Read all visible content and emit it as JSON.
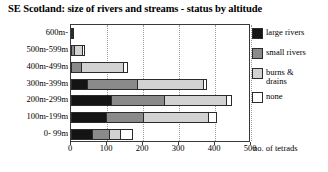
{
  "chart_data": {
    "type": "bar",
    "orientation": "horizontal",
    "stacked": true,
    "title": "SE Scotland: size of rivers and streams - status by altitude",
    "xlabel": "no. of tetrads",
    "ylabel": "",
    "xlim": [
      0,
      500
    ],
    "xticks": [
      0,
      100,
      200,
      300,
      400,
      500
    ],
    "grid": true,
    "legend_position": "right",
    "categories": [
      "600m-",
      "500m-599m",
      "400m-499m",
      "300m-399m",
      "200m-299m",
      "100m-199m",
      "0- 99m"
    ],
    "series": [
      {
        "name": "large rivers",
        "color": "#141414",
        "values": [
          0,
          0,
          0,
          48,
          115,
          100,
          62
        ]
      },
      {
        "name": "small rivers",
        "color": "#8a8a8a",
        "values": [
          0,
          12,
          30,
          142,
          150,
          105,
          48
        ]
      },
      {
        "name": "burns & drains",
        "color": "#d2d2d2",
        "values": [
          4,
          23,
          120,
          185,
          175,
          185,
          35
        ]
      },
      {
        "name": "none",
        "color": "#ffffff",
        "values": [
          1,
          10,
          15,
          10,
          15,
          25,
          35
        ]
      }
    ],
    "totals": [
      5,
      45,
      165,
      385,
      455,
      415,
      180
    ]
  },
  "legend": {
    "items": [
      {
        "label": "large rivers"
      },
      {
        "label": "small rivers"
      },
      {
        "label": "burns &\ndrains"
      },
      {
        "label": "none"
      }
    ]
  },
  "axis": {
    "x_title": "no. of tetrads",
    "x_tick_labels": [
      "0",
      "100",
      "200",
      "300",
      "400",
      "500"
    ],
    "y_tick_labels": [
      "600m-",
      "500m-599m",
      "400m-499m",
      "300m-399m",
      "200m-299m",
      "100m-199m",
      "0- 99m"
    ]
  }
}
